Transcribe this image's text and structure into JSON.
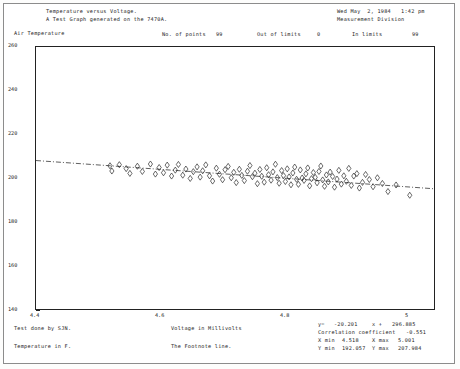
{
  "header": {
    "title_line1": "Temperature versus Voltage.",
    "title_line2": "A Test Graph generated on the 7470A.",
    "date": "Wed May  2, 1984   1:42 pm",
    "division": "Measurement Division"
  },
  "stats_top": {
    "points_label": "No. of points",
    "points_value": "99",
    "out_of_limits_label": "Out of limits",
    "out_of_limits_value": "0",
    "in_limits_label": "In limits",
    "in_limits_value": "99"
  },
  "footer": {
    "test_by": "Test done by SJN.",
    "temperature_units": "Temperature in F.",
    "x_caption": "Voltage in Millivolts",
    "footnote": "The Footnote line."
  },
  "fit": {
    "y_label": "y=",
    "slope": "-20.201",
    "x_label": "x +",
    "intercept": "296.885",
    "corr_label": "Correlation coefficient",
    "corr_value": "-0.551",
    "xmin_label": "X min",
    "xmin_value": "4.518",
    "xmax_label": "X max",
    "xmax_value": "5.001",
    "ymin_label": "Y min",
    "ymin_value": "192.057",
    "ymax_label": "Y max",
    "ymax_value": "207.984"
  },
  "colors": {
    "ink": "#1a1a1a",
    "frame": "#222222",
    "paper": "#ffffff",
    "edge": "#8c8c8c"
  },
  "chart_data": {
    "type": "scatter",
    "title": "Temperature versus Voltage.",
    "subtitle": "A Test Graph generated on the 7470A.",
    "xlabel": "Voltage in Millivolts",
    "ylabel": "Air Temperature",
    "xlim": [
      4.4,
      5.04
    ],
    "ylim": [
      140,
      260
    ],
    "xticks": [
      4.4,
      4.6,
      4.8,
      5
    ],
    "xtick_labels": [
      "4.4",
      "4.6",
      "4.8",
      "5"
    ],
    "yticks": [
      140,
      160,
      180,
      200,
      220,
      240,
      260
    ],
    "ytick_labels": [
      "140",
      "160",
      "180",
      "200",
      "220",
      "240",
      "260"
    ],
    "grid": false,
    "legend": null,
    "marker": "diamond",
    "n_points": 99,
    "fit_line": {
      "style": "dash-dot",
      "slope": -20.201,
      "intercept": 296.885,
      "correlation": -0.551
    },
    "x": [
      4.519,
      4.522,
      4.534,
      4.545,
      4.551,
      4.563,
      4.571,
      4.584,
      4.592,
      4.598,
      4.605,
      4.611,
      4.618,
      4.624,
      4.629,
      4.636,
      4.641,
      4.648,
      4.653,
      4.659,
      4.664,
      4.668,
      4.673,
      4.679,
      4.684,
      4.69,
      4.695,
      4.7,
      4.704,
      4.709,
      4.714,
      4.718,
      4.722,
      4.727,
      4.731,
      4.735,
      4.74,
      4.744,
      4.748,
      4.752,
      4.756,
      4.76,
      4.763,
      4.767,
      4.771,
      4.774,
      4.778,
      4.781,
      4.785,
      4.788,
      4.791,
      4.795,
      4.798,
      4.801,
      4.804,
      4.807,
      4.81,
      4.813,
      4.816,
      4.819,
      4.822,
      4.825,
      4.828,
      4.831,
      4.834,
      4.837,
      4.84,
      4.843,
      4.846,
      4.849,
      4.852,
      4.855,
      4.858,
      4.861,
      4.864,
      4.867,
      4.87,
      4.873,
      4.877,
      4.88,
      4.884,
      4.887,
      4.891,
      4.895,
      4.899,
      4.903,
      4.907,
      4.911,
      4.916,
      4.92,
      4.925,
      4.93,
      4.936,
      4.942,
      4.949,
      4.957,
      4.966,
      4.979,
      5.001
    ],
    "y": [
      205.6,
      203.2,
      206.1,
      204.3,
      202.1,
      205.4,
      203.0,
      206.4,
      201.8,
      204.8,
      202.4,
      205.9,
      200.9,
      203.6,
      206.2,
      201.3,
      204.1,
      199.8,
      202.9,
      205.1,
      200.4,
      203.3,
      206.0,
      201.0,
      198.6,
      204.5,
      201.7,
      199.2,
      203.8,
      205.3,
      200.1,
      202.6,
      197.9,
      204.0,
      201.2,
      198.8,
      203.1,
      205.7,
      200.6,
      202.2,
      197.4,
      203.9,
      200.8,
      198.1,
      204.7,
      201.5,
      199.0,
      202.8,
      206.3,
      200.2,
      197.6,
      203.4,
      201.1,
      198.4,
      204.2,
      200.5,
      196.9,
      202.3,
      205.0,
      199.4,
      197.1,
      203.7,
      200.0,
      198.9,
      201.9,
      204.6,
      196.4,
      199.7,
      202.5,
      200.3,
      197.8,
      203.0,
      205.5,
      199.1,
      196.2,
      201.4,
      198.2,
      202.7,
      200.7,
      195.8,
      199.5,
      203.5,
      197.2,
      201.0,
      198.5,
      204.4,
      196.6,
      200.9,
      202.0,
      195.4,
      198.0,
      201.6,
      199.3,
      196.0,
      200.1,
      197.5,
      193.8,
      196.8,
      192.1
    ]
  }
}
